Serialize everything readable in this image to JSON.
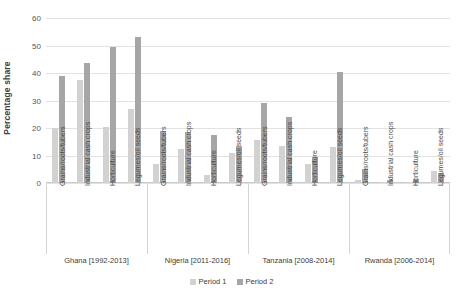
{
  "chart_data": {
    "type": "bar",
    "title": "",
    "xlabel": "",
    "ylabel": "Percentage share",
    "ylim": [
      0,
      60
    ],
    "yticks": [
      0,
      10,
      20,
      30,
      40,
      50,
      60
    ],
    "grid": true,
    "legend_position": "bottom",
    "categories": [
      "Grains/roots/tubers",
      "Industrial cash crops",
      "Horticulture",
      "Legumes/oil seeds"
    ],
    "groups": [
      {
        "name": "Ghana [1992-2013]",
        "series": [
          {
            "name": "Period 1",
            "values": [
              20.0,
              37.5,
              20.5,
              27.0
            ]
          },
          {
            "name": "Period 2",
            "values": [
              39.0,
              43.5,
              49.5,
              53.0
            ]
          }
        ]
      },
      {
        "name": "Nigeria [2011-2016]",
        "series": [
          {
            "name": "Period 1",
            "values": [
              7.0,
              12.5,
              3.0,
              11.0
            ]
          },
          {
            "name": "Period 2",
            "values": [
              19.0,
              18.5,
              17.5,
              13.5
            ]
          }
        ]
      },
      {
        "name": "Tanzania [2008-2014]",
        "series": [
          {
            "name": "Period 1",
            "values": [
              15.5,
              13.5,
              7.0,
              13.0
            ]
          },
          {
            "name": "Period 2",
            "values": [
              29.0,
              24.0,
              9.5,
              40.5
            ]
          }
        ]
      },
      {
        "name": "Rwanda [2006-2014]",
        "series": [
          {
            "name": "Period 1",
            "values": [
              1.0,
              0.4,
              0.5,
              4.5
            ]
          },
          {
            "name": "Period 2",
            "values": [
              5.0,
              1.0,
              1.5,
              3.5
            ]
          }
        ]
      }
    ],
    "legend": [
      {
        "label": "Period 1",
        "color": "#d2d2d2"
      },
      {
        "label": "Period 2",
        "color": "#a6a6a6"
      }
    ],
    "colors": {
      "period_1": "#d2d2d2",
      "period_2": "#a6a6a6",
      "gridline": "#e2e2e2",
      "axis": "#c9c9c9",
      "text": "#3d3d3d"
    }
  }
}
